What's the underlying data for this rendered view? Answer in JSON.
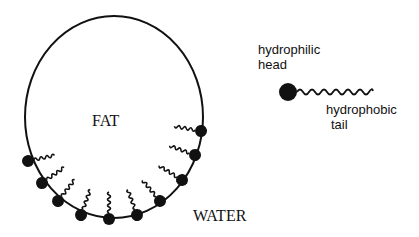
{
  "diagram": {
    "fat_label": "FAT",
    "water_label": "WATER",
    "legend": {
      "head_label_line1": "hydrophilic",
      "head_label_line2": "head",
      "tail_label_line1": "hydrophobic",
      "tail_label_line2": "tail"
    },
    "colors": {
      "stroke": "#111111",
      "background": "#ffffff"
    }
  }
}
